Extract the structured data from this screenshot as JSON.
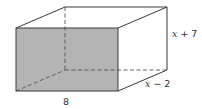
{
  "figure": {
    "type": "rectangular-prism",
    "shaded_face": "front",
    "labels": {
      "width": "8",
      "height_var": "x",
      "height_rest": " + 7",
      "depth_var": "x",
      "depth_rest": " − 2"
    },
    "colors": {
      "shade": "#b4b4b4",
      "edge": "#3a3a3a",
      "hidden_edge": "#555555",
      "background": "#ffffff"
    }
  }
}
